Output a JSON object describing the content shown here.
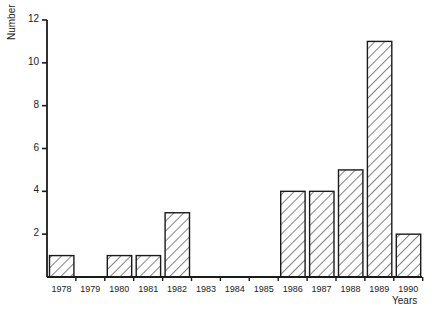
{
  "chart_data": {
    "type": "bar",
    "title": "",
    "xlabel": "Years",
    "ylabel": "Number",
    "ylim": [
      0,
      12
    ],
    "yticks": [
      2,
      4,
      6,
      8,
      10,
      12
    ],
    "grid": false,
    "legend": null,
    "fill_pattern": "diagonal-hatch",
    "categories": [
      "1978",
      "1979",
      "1980",
      "1981",
      "1982",
      "1983",
      "1984",
      "1985",
      "1986",
      "1987",
      "1988",
      "1989",
      "1990"
    ],
    "values": [
      1,
      0,
      1,
      1,
      3,
      0,
      0,
      0,
      4,
      4,
      5,
      11,
      2
    ]
  },
  "colors": {
    "line": "#1a1a1a",
    "background": "#ffffff"
  }
}
